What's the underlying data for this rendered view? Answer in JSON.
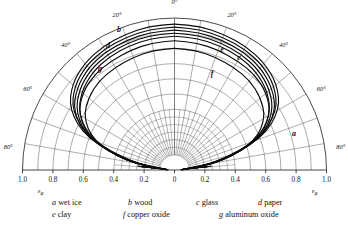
{
  "figure": {
    "axis_symbol_left": "ε",
    "axis_symbol_sub": "φ"
  },
  "chart_data": {
    "type": "line",
    "plot_style": "polar-half",
    "title": "",
    "subtitle": "",
    "xlabel": "εφ",
    "ylabel": "",
    "grid": true,
    "legend_position": "below",
    "angle_unit": "degrees",
    "angle_labels_left": [
      "0°",
      "20°",
      "40°",
      "60°",
      "80°"
    ],
    "angle_labels_right": [
      "0°",
      "20°",
      "40°",
      "60°",
      "80°"
    ],
    "angle_ticks": [
      0,
      20,
      40,
      60,
      80
    ],
    "radial_ticks": [
      0,
      0.2,
      0.4,
      0.6,
      0.8,
      1.0
    ],
    "x_tick_labels": [
      "1.0",
      "0.8",
      "0.6",
      "0.4",
      "0.2",
      "0",
      "0.2",
      "0.4",
      "0.6",
      "0.8",
      "1.0"
    ],
    "xlim": [
      -1.0,
      1.0
    ],
    "rlim": [
      0,
      1.0
    ],
    "series": [
      {
        "name": "a",
        "label": "a",
        "material": "wet ice",
        "values": [
          0.96,
          0.96,
          0.95,
          0.94,
          0.92,
          0.88,
          0.8,
          0.62,
          0.3,
          0.05
        ]
      },
      {
        "name": "b",
        "label": "b",
        "material": "wood",
        "values": [
          0.9,
          0.9,
          0.89,
          0.88,
          0.86,
          0.82,
          0.75,
          0.6,
          0.32,
          0.06
        ]
      },
      {
        "name": "c",
        "label": "c",
        "material": "glass",
        "values": [
          0.94,
          0.94,
          0.93,
          0.92,
          0.9,
          0.86,
          0.78,
          0.6,
          0.28,
          0.05
        ]
      },
      {
        "name": "d",
        "label": "d",
        "material": "paper",
        "values": [
          0.88,
          0.88,
          0.87,
          0.86,
          0.84,
          0.8,
          0.73,
          0.58,
          0.31,
          0.06
        ]
      },
      {
        "name": "e",
        "label": "e",
        "material": "clay",
        "values": [
          0.92,
          0.92,
          0.91,
          0.9,
          0.88,
          0.84,
          0.77,
          0.61,
          0.3,
          0.05
        ]
      },
      {
        "name": "f",
        "label": "f",
        "material": "copper oxide",
        "values": [
          0.8,
          0.8,
          0.79,
          0.78,
          0.77,
          0.74,
          0.69,
          0.57,
          0.33,
          0.07
        ]
      },
      {
        "name": "g",
        "label": "g",
        "material": "aluminum oxide",
        "values": [
          0.85,
          0.85,
          0.84,
          0.83,
          0.82,
          0.79,
          0.73,
          0.59,
          0.32,
          0.06
        ]
      }
    ],
    "series_angles": [
      0,
      10,
      20,
      30,
      40,
      50,
      60,
      70,
      80,
      88
    ]
  },
  "curve_labels": {
    "a": "a",
    "b": "b",
    "c": "c",
    "d": "d",
    "e": "e",
    "f": "f",
    "g": "g"
  },
  "angles": {
    "deg0": "0°",
    "deg20": "20°",
    "deg40": "40°",
    "deg60": "60°",
    "deg80": "80°"
  },
  "xticks": {
    "t0": "1.0",
    "t1": "0.8",
    "t2": "0.6",
    "t3": "0.4",
    "t4": "0.2",
    "t5": "0",
    "t6": "0.2",
    "t7": "0.4",
    "t8": "0.6",
    "t9": "0.8",
    "t10": "1.0"
  },
  "axis": {
    "eps_left": "ε",
    "eps_right": "ε",
    "phi_left": "φ",
    "phi_right": "φ"
  },
  "legend": {
    "row1": [
      {
        "key": "a",
        "text": "wet ice"
      },
      {
        "key": "b",
        "text": "wood"
      },
      {
        "key": "c",
        "text": "glass"
      },
      {
        "key": "d",
        "text": "paper"
      }
    ],
    "row2": [
      {
        "key": "e",
        "text": "clay"
      },
      {
        "key": "f",
        "text": "copper oxide"
      },
      {
        "key": "g",
        "text": "aluminum oxide"
      }
    ]
  },
  "colors": {
    "curve": "#0b0b0b",
    "grid": "#4a4a4a",
    "axis": "#1a1a1a",
    "background": "#ffffff"
  }
}
